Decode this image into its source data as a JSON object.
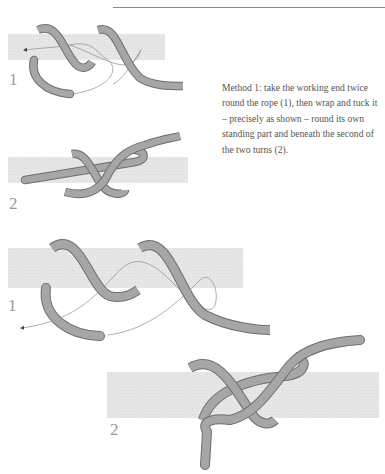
{
  "page": {
    "caption": "Method 1: take the working end twice round the rope (1), then wrap and tuck it – precisely as shown – round its own standing part and beneath the second of the two turns (2).",
    "colors": {
      "rope": "#a6a6a6",
      "rope_outline": "#6e6e6e",
      "standing_part": "#e6e6e6",
      "path_line": "#8c8c8c",
      "step_label": "#9a9a9a"
    }
  },
  "figures": [
    {
      "id": "small-step-1",
      "label": "1"
    },
    {
      "id": "small-step-2",
      "label": "2"
    },
    {
      "id": "large-step-1",
      "label": "1"
    },
    {
      "id": "large-step-2",
      "label": "2"
    }
  ]
}
